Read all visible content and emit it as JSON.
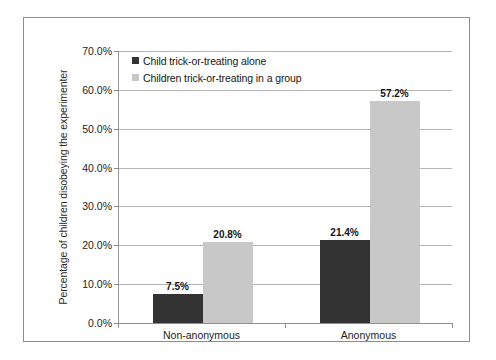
{
  "chart_data": {
    "type": "bar",
    "title": "",
    "subtitle": "",
    "xlabel": "",
    "ylabel": "Percentage of children disobeying the experimenter",
    "categories": [
      "Non-anonymous",
      "Anonymous"
    ],
    "series": [
      {
        "name": "Child trick-or-treating alone",
        "color": "#333333",
        "values": [
          7.5,
          21.4
        ],
        "labels": [
          "7.5%",
          "21.4%"
        ]
      },
      {
        "name": "Children trick-or-treating in a group",
        "color": "#c8c8c8",
        "values": [
          20.8,
          57.2
        ],
        "labels": [
          "20.8%",
          "57.2%"
        ]
      }
    ],
    "ylim": [
      0,
      70
    ],
    "ytick_values": [
      0,
      10,
      20,
      30,
      40,
      50,
      60,
      70
    ],
    "ytick_labels": [
      "0.0%",
      "10.0%",
      "20.0%",
      "30.0%",
      "40.0%",
      "50.0%",
      "60.0%",
      "70.0%"
    ],
    "grid": true,
    "legend_position": "top-left",
    "value_labels": true
  },
  "legend": {
    "items": [
      {
        "label": "Child trick-or-treating alone",
        "color": "#333333"
      },
      {
        "label": "Children trick-or-treating in a group",
        "color": "#c8c8c8"
      }
    ]
  },
  "colors": {
    "series_dark": "#333333",
    "series_light": "#c8c8c8",
    "grid": "#b6b6b6",
    "axis": "#8f8f8f",
    "frame": "#8d8d8d",
    "background": "#ffffff",
    "text": "#1d1d1d"
  }
}
